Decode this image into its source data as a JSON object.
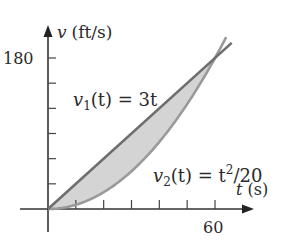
{
  "chart_data": {
    "type": "line",
    "title": "",
    "xlabel": "t (s)",
    "ylabel": "v (ft/s)",
    "x_axis": {
      "var": "t",
      "unit": "(s)",
      "range": [
        0,
        66
      ],
      "tick_step": 10,
      "labeled_ticks": [
        {
          "value": 60,
          "label": "60"
        }
      ]
    },
    "y_axis": {
      "var": "v",
      "unit": "(ft/s)",
      "range": [
        0,
        200
      ],
      "tick_step": 30,
      "labeled_ticks": [
        {
          "value": 180,
          "label": "180"
        }
      ]
    },
    "grid": false,
    "legend": "none (inline curve labels)",
    "series": [
      {
        "name": "v1(t) = 3t",
        "label_main": "v",
        "label_sub": "1",
        "label_rest": "(t) = 3t",
        "formula": "3t",
        "x": [
          0,
          10,
          20,
          30,
          40,
          50,
          60,
          66
        ],
        "values": [
          0,
          30,
          60,
          90,
          120,
          150,
          180,
          198
        ]
      },
      {
        "name": "v2(t) = t^2/20",
        "label_main": "v",
        "label_sub": "2",
        "label_mid": "(t) = t",
        "label_sup": "2",
        "label_rest": "/20",
        "formula": "t^2/20",
        "x": [
          0,
          10,
          20,
          30,
          40,
          50,
          60,
          64
        ],
        "values": [
          0,
          5,
          20,
          45,
          80,
          125,
          180,
          204.8
        ]
      }
    ],
    "annotations": [
      {
        "type": "shaded_region",
        "between": [
          "v1(t) = 3t",
          "v2(t) = t^2/20"
        ],
        "x_range": [
          0,
          60
        ],
        "color": "#d4d4d4"
      },
      {
        "type": "intersection",
        "x": 60,
        "y": 180
      }
    ]
  },
  "labels": {
    "y_axis_var": "v",
    "y_axis_unit": "(ft/s)",
    "x_axis_var": "t",
    "x_axis_unit": "(s)",
    "y_tick_180": "180",
    "x_tick_60": "60",
    "v1_main": "v",
    "v1_sub": "1",
    "v1_rest": "(t) = 3t",
    "v2_main": "v",
    "v2_sub": "2",
    "v2_mid": "(t) = t",
    "v2_sup": "2",
    "v2_rest": "/20"
  },
  "colors": {
    "axis": "#333333",
    "line_v1": "#6e6e6e",
    "curve_v2": "#9a9a9a",
    "shade": "#d4d4d4",
    "text": "#2a2a2a"
  }
}
